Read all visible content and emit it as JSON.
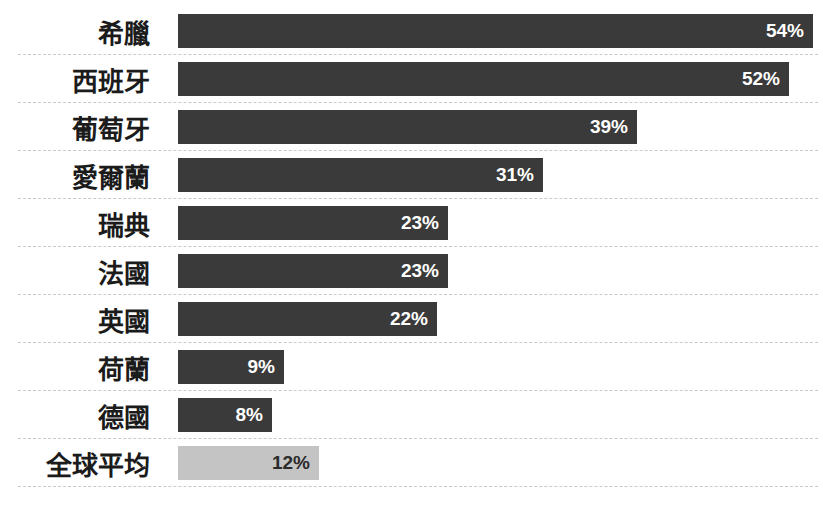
{
  "chart_data": {
    "type": "bar",
    "orientation": "horizontal",
    "title": "",
    "subtitle": "",
    "xlabel": "",
    "ylabel": "",
    "grid": false,
    "legend": "none",
    "value_suffix": "%",
    "xlim": [
      0,
      54
    ],
    "categories": [
      "希臘",
      "西班牙",
      "葡萄牙",
      "愛爾蘭",
      "瑞典",
      "法國",
      "英國",
      "荷蘭",
      "德國",
      "全球平均"
    ],
    "values": [
      54,
      52,
      39,
      31,
      23,
      23,
      22,
      9,
      8,
      12
    ],
    "value_labels": [
      "54%",
      "52%",
      "39%",
      "31%",
      "23%",
      "23%",
      "22%",
      "9%",
      "8%",
      "12%"
    ],
    "series": [
      {
        "name": "",
        "values": [
          54,
          52,
          39,
          31,
          23,
          23,
          22,
          9,
          8,
          12
        ]
      }
    ],
    "bars": [
      {
        "label": "希臘",
        "value": 54,
        "value_label": "54%",
        "highlight": false
      },
      {
        "label": "西班牙",
        "value": 52,
        "value_label": "52%",
        "highlight": false
      },
      {
        "label": "葡萄牙",
        "value": 39,
        "value_label": "39%",
        "highlight": false
      },
      {
        "label": "愛爾蘭",
        "value": 31,
        "value_label": "31%",
        "highlight": false
      },
      {
        "label": "瑞典",
        "value": 23,
        "value_label": "23%",
        "highlight": false
      },
      {
        "label": "法國",
        "value": 23,
        "value_label": "23%",
        "highlight": false
      },
      {
        "label": "英國",
        "value": 22,
        "value_label": "22%",
        "highlight": false
      },
      {
        "label": "荷蘭",
        "value": 9,
        "value_label": "9%",
        "highlight": false
      },
      {
        "label": "德國",
        "value": 8,
        "value_label": "8%",
        "highlight": false
      },
      {
        "label": "全球平均",
        "value": 12,
        "value_label": "12%",
        "highlight": true
      }
    ],
    "colors": {
      "background": "#ffffff",
      "bar": "#3a3a3a",
      "bar_highlight": "#c4c4c4",
      "bar_value_text": "#ffffff",
      "bar_value_text_highlight": "#2b2b2b",
      "category_label": "#1b1b1b",
      "separator": "#c9c9c9"
    }
  }
}
